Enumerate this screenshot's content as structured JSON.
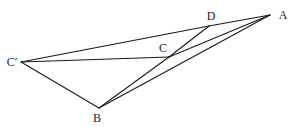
{
  "figure": {
    "type": "geometry",
    "points": {
      "A": {
        "label": "A",
        "x": 270,
        "y": 15,
        "lx": 283,
        "ly": 15
      },
      "D": {
        "label": "D",
        "x": 209,
        "y": 26,
        "lx": 211,
        "ly": 16
      },
      "C": {
        "label": "C",
        "x": 169,
        "y": 57,
        "lx": 163,
        "ly": 48
      },
      "Cp": {
        "label": "C′",
        "x": 21,
        "y": 62,
        "lx": 12,
        "ly": 62
      },
      "B": {
        "label": "B",
        "x": 99,
        "y": 108,
        "lx": 97,
        "ly": 118
      }
    },
    "segments": [
      [
        "Cp",
        "D"
      ],
      [
        "D",
        "A"
      ],
      [
        "Cp",
        "C"
      ],
      [
        "Cp",
        "B"
      ],
      [
        "B",
        "C"
      ],
      [
        "C",
        "D"
      ],
      [
        "C",
        "A"
      ],
      [
        "B",
        "A"
      ]
    ],
    "line_color": "#1a1a1a"
  }
}
